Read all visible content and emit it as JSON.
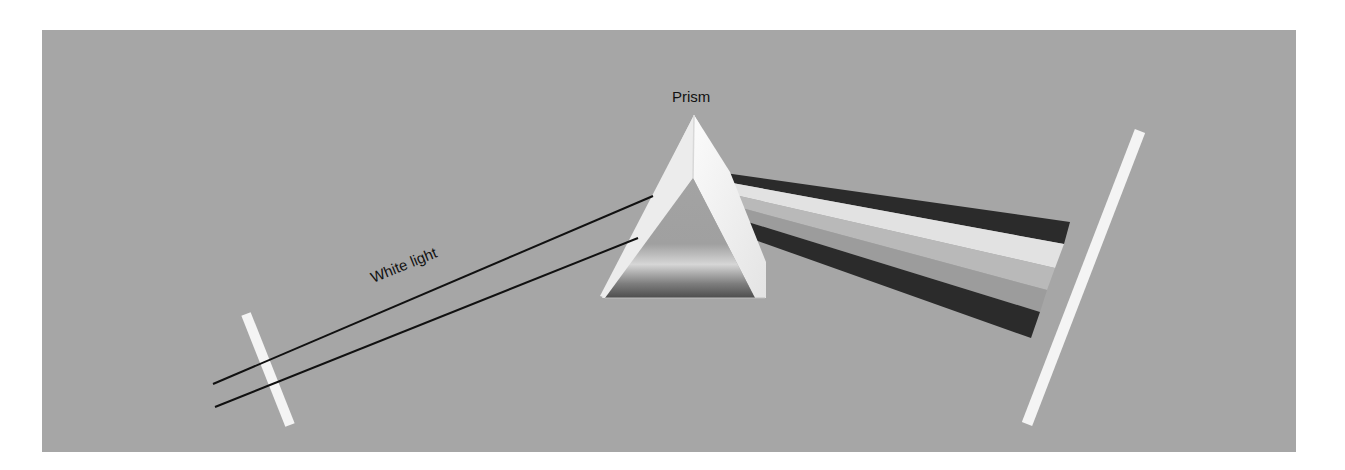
{
  "diagram": {
    "labels": {
      "prism": "Prism",
      "white_light": "White light"
    },
    "components": [
      {
        "id": "entrance-slit",
        "type": "slit",
        "description": "narrow white slit at left"
      },
      {
        "id": "white-light-rays",
        "type": "ray-pair",
        "count": 2
      },
      {
        "id": "prism",
        "type": "triangular-prism"
      },
      {
        "id": "spectrum-bands",
        "type": "dispersed-beam",
        "band_count": 5
      },
      {
        "id": "screen",
        "type": "screen",
        "description": "white screen at right"
      }
    ],
    "spectrum_bands": [
      {
        "name": "band-1",
        "tone": "dark"
      },
      {
        "name": "band-2",
        "tone": "light"
      },
      {
        "name": "band-3",
        "tone": "mid-gray"
      },
      {
        "name": "band-4",
        "tone": "gray"
      },
      {
        "name": "band-5",
        "tone": "dark"
      }
    ],
    "colors": {
      "background": "#a6a6a6",
      "slit": "#f4f4f4",
      "screen": "#f4f4f4",
      "ray": "#111111",
      "band_dark": "#2b2b2b",
      "band_light": "#e2e2e2",
      "band_mid": "#b9b9b9",
      "band_gray": "#9c9c9c"
    }
  }
}
